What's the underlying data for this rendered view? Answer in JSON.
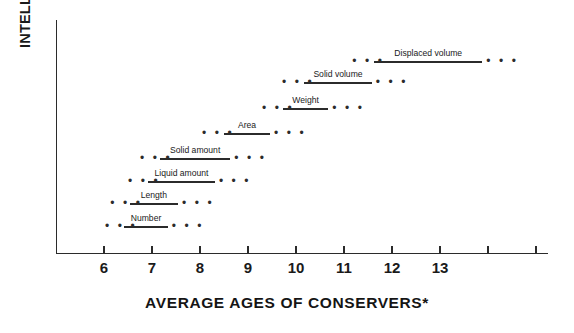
{
  "chart_data": {
    "type": "line",
    "title": "",
    "xlabel": "AVERAGE AGES OF CONSERVERS*",
    "ylabel": "INTELLECTUAL DEVELOPMENT",
    "xlim": [
      5.0,
      15.25
    ],
    "grid": false,
    "legend": "none",
    "x_ticks": [
      {
        "value": 6,
        "label": "6"
      },
      {
        "value": 7,
        "label": "7"
      },
      {
        "value": 8,
        "label": "8"
      },
      {
        "value": 9,
        "label": "9"
      },
      {
        "value": 10,
        "label": "10"
      },
      {
        "value": 11,
        "label": "11"
      },
      {
        "value": 12,
        "label": "12"
      },
      {
        "value": 13,
        "label": "13"
      },
      {
        "value": 14,
        "label": ""
      },
      {
        "value": 15,
        "label": ""
      }
    ],
    "y_ticks": [],
    "dots_text": "• • •",
    "series": [
      {
        "name": "Number",
        "label": "Number",
        "order": 1,
        "dots_left_start": 6.02,
        "range_start": 6.42,
        "range_end": 7.33,
        "dots_right_end": 7.75
      },
      {
        "name": "Length",
        "label": "Length",
        "order": 2,
        "dots_left_start": 6.13,
        "range_start": 6.54,
        "range_end": 7.54,
        "dots_right_end": 7.96
      },
      {
        "name": "Liquid amount",
        "label": "Liquid amount",
        "order": 3,
        "dots_left_start": 6.5,
        "range_start": 6.92,
        "range_end": 8.31,
        "dots_right_end": 8.73
      },
      {
        "name": "Solid amount",
        "label": "Solid amount",
        "order": 4,
        "dots_left_start": 6.75,
        "range_start": 7.17,
        "range_end": 8.63,
        "dots_right_end": 9.1
      },
      {
        "name": "Area",
        "label": "Area",
        "order": 5,
        "dots_left_start": 8.04,
        "range_start": 8.5,
        "range_end": 9.46,
        "dots_right_end": 9.92
      },
      {
        "name": "Weight",
        "label": "Weight",
        "order": 6,
        "dots_left_start": 9.29,
        "range_start": 9.73,
        "range_end": 10.67,
        "dots_right_end": 11.13
      },
      {
        "name": "Solid volume",
        "label": "Solid volume",
        "order": 7,
        "dots_left_start": 9.71,
        "range_start": 10.17,
        "range_end": 11.58,
        "dots_right_end": 12.06
      },
      {
        "name": "Displaced volume",
        "label": "Displaced volume",
        "order": 8,
        "dots_left_start": 11.17,
        "range_start": 11.63,
        "range_end": 13.88,
        "dots_right_end": 14.35
      }
    ]
  },
  "colors": {
    "ink": "#2b2b2b",
    "text": "#1a1a1a",
    "background": "#ffffff"
  }
}
